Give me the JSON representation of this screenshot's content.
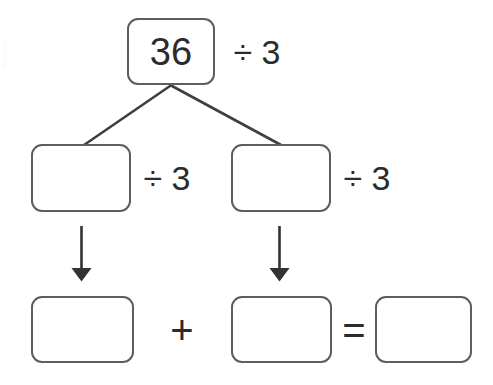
{
  "worksheet": {
    "title": "Division decomposition diagram",
    "stroke_color": "#5e5e5e",
    "text_color": "#2b2b2b",
    "background_color": "#ffffff"
  },
  "top_row": {
    "dividend": "36",
    "divisor_label": "÷ 3"
  },
  "middle_row": {
    "left_part": "",
    "left_divisor_label": "÷ 3",
    "right_part": "",
    "right_divisor_label": "÷ 3"
  },
  "bottom_row": {
    "left_quotient": "",
    "plus_sign": "+",
    "right_quotient": "",
    "equals_sign": "=",
    "answer": ""
  },
  "connectors": {
    "branch_left_name": "branch-line-left",
    "branch_right_name": "branch-line-right",
    "arrow_left_name": "down-arrow-left",
    "arrow_right_name": "down-arrow-right"
  }
}
